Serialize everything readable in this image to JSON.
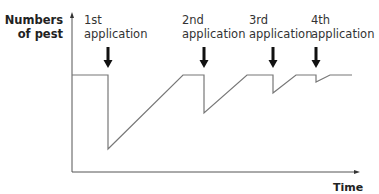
{
  "axes": {
    "y_label_line1": "Numbers",
    "y_label_line2": "of pest",
    "x_label": "Time"
  },
  "applications": [
    {
      "ordinal": "1st",
      "label": "application"
    },
    {
      "ordinal": "2nd",
      "label": "application"
    },
    {
      "ordinal": "3rd",
      "label": "application"
    },
    {
      "ordinal": "4th",
      "label": "application"
    }
  ],
  "colors": {
    "line": "#777777",
    "axis": "#555555",
    "arrow": "#111111"
  }
}
